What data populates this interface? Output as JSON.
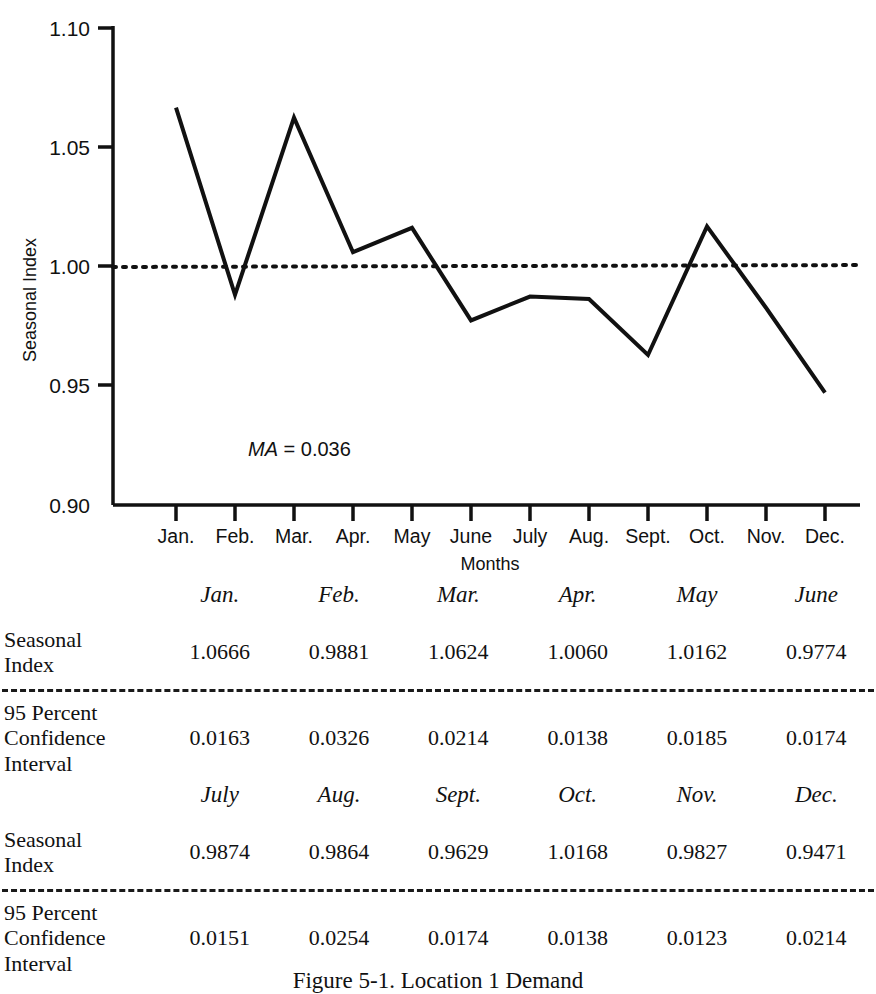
{
  "chart_data": {
    "type": "line",
    "title": "",
    "xlabel": "Months",
    "ylabel": "Seasonal Index",
    "categories": [
      "Jan.",
      "Feb.",
      "Mar.",
      "Apr.",
      "May",
      "June",
      "July",
      "Aug.",
      "Sept.",
      "Oct.",
      "Nov.",
      "Dec."
    ],
    "series": [
      {
        "name": "Seasonal Index",
        "style": "solid",
        "values": [
          1.0666,
          0.9881,
          1.0624,
          1.006,
          1.0162,
          0.9774,
          0.9874,
          0.9864,
          0.9629,
          1.0168,
          0.9827,
          0.9471
        ]
      },
      {
        "name": "Reference line",
        "style": "dotted",
        "values": [
          0.9998,
          0.9999,
          1.0,
          1.0001,
          1.0002,
          1.0003,
          1.0004,
          1.0004,
          1.0005,
          1.0005,
          1.0006,
          1.0006
        ]
      }
    ],
    "ylim": [
      0.9,
      1.1
    ],
    "yticks": [
      "0.90",
      "0.95",
      "1.00",
      "1.05",
      "1.10"
    ],
    "ytick_values": [
      0.9,
      0.95,
      1.0,
      1.05,
      1.1
    ],
    "grid": false,
    "legend": "none",
    "annotations": [
      {
        "italic_text": "MA",
        "plain_text": " = 0.036",
        "value": 0.036
      }
    ]
  },
  "chart": {
    "ylabel": "Seasonal Index",
    "xlabel": "Months",
    "yticks": [
      "1.10",
      "1.05",
      "1.00",
      "0.95",
      "0.90"
    ],
    "xticks": [
      "Jan.",
      "Feb.",
      "Mar.",
      "Apr.",
      "May",
      "June",
      "July",
      "Aug.",
      "Sept.",
      "Oct.",
      "Nov.",
      "Dec."
    ],
    "annotation_italic": "MA",
    "annotation_plain": " = 0.036"
  },
  "tables": [
    {
      "months": [
        "Jan.",
        "Feb.",
        "Mar.",
        "Apr.",
        "May",
        "June"
      ],
      "rows": [
        {
          "label": "Seasonal\nIndex",
          "values": [
            "1.0666",
            "0.9881",
            "1.0624",
            "1.0060",
            "1.0162",
            "0.9774"
          ]
        },
        {
          "label": "95 Percent\nConfidence\nInterval",
          "values": [
            "0.0163",
            "0.0326",
            "0.0214",
            "0.0138",
            "0.0185",
            "0.0174"
          ]
        }
      ]
    },
    {
      "months": [
        "July",
        "Aug.",
        "Sept.",
        "Oct.",
        "Nov.",
        "Dec."
      ],
      "rows": [
        {
          "label": "Seasonal\nIndex",
          "values": [
            "0.9874",
            "0.9864",
            "0.9629",
            "1.0168",
            "0.9827",
            "0.9471"
          ]
        },
        {
          "label": "95 Percent\nConfidence\nInterval",
          "values": [
            "0.0151",
            "0.0254",
            "0.0174",
            "0.0138",
            "0.0123",
            "0.0214"
          ]
        }
      ]
    }
  ],
  "caption": "Figure 5-1. Location 1 Demand",
  "colors": {
    "ink": "#111111",
    "paper": "#ffffff"
  }
}
